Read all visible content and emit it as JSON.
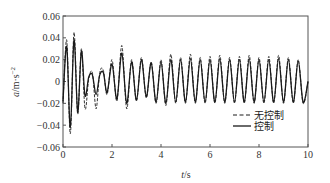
{
  "chart_data": {
    "type": "line",
    "title": "",
    "xlabel": "t/s",
    "ylabel": "a/m·s⁻²",
    "xlim": [
      0,
      10
    ],
    "ylim": [
      -0.06,
      0.06
    ],
    "x_ticks": [
      "0",
      "2",
      "4",
      "6",
      "8",
      "10"
    ],
    "y_ticks": [
      "0.06",
      "0.04",
      "0.02",
      "0",
      "-0.02",
      "-0.04",
      "-0.06"
    ],
    "grid": false,
    "legend_position": "lower right inside",
    "legend": [
      {
        "label": "无控制",
        "style": "dashed"
      },
      {
        "label": "控制",
        "style": "solid"
      }
    ],
    "series": [
      {
        "name": "无控制",
        "style": "dashed",
        "x": [
          0,
          0.15,
          0.3,
          0.45,
          0.6,
          0.75,
          0.9,
          1.05,
          1.2,
          1.35,
          1.5,
          1.65,
          1.8,
          2.0,
          2.2,
          2.4,
          2.6,
          2.8,
          3.0,
          3.2,
          3.4,
          3.6,
          3.8,
          4.0,
          4.2,
          4.4,
          4.6,
          4.8,
          5.0,
          5.2,
          5.4,
          5.6,
          5.8,
          6.0,
          6.2,
          6.4,
          6.6,
          6.8,
          7.0,
          7.2,
          7.4,
          7.6,
          7.8,
          8.0,
          8.2,
          8.4,
          8.6,
          8.8,
          9.0,
          9.2,
          9.4,
          9.6,
          9.8,
          10.0
        ],
        "y": [
          -0.02,
          0.038,
          -0.048,
          0.045,
          -0.03,
          0.03,
          -0.025,
          0.002,
          0.008,
          -0.025,
          0.008,
          0.01,
          -0.012,
          0.02,
          -0.018,
          0.033,
          -0.025,
          0.02,
          -0.018,
          0.022,
          -0.015,
          0.018,
          -0.02,
          0.02,
          -0.022,
          0.025,
          -0.02,
          0.022,
          -0.02,
          0.025,
          -0.02,
          0.022,
          -0.02,
          0.023,
          -0.02,
          0.024,
          -0.02,
          0.022,
          -0.02,
          0.023,
          -0.02,
          0.024,
          -0.02,
          0.022,
          -0.02,
          0.023,
          -0.02,
          0.024,
          -0.02,
          0.022,
          -0.02,
          0.02,
          -0.02,
          0.0
        ]
      },
      {
        "name": "控制",
        "style": "solid",
        "x": [
          0,
          0.15,
          0.3,
          0.45,
          0.6,
          0.75,
          0.9,
          1.05,
          1.2,
          1.35,
          1.5,
          1.65,
          1.8,
          2.0,
          2.2,
          2.4,
          2.6,
          2.8,
          3.0,
          3.2,
          3.4,
          3.6,
          3.8,
          4.0,
          4.2,
          4.4,
          4.6,
          4.8,
          5.0,
          5.2,
          5.4,
          5.6,
          5.8,
          6.0,
          6.2,
          6.4,
          6.6,
          6.8,
          7.0,
          7.2,
          7.4,
          7.6,
          7.8,
          8.0,
          8.2,
          8.4,
          8.6,
          8.8,
          9.0,
          9.2,
          9.4,
          9.6,
          9.8,
          10.0
        ],
        "y": [
          -0.018,
          0.032,
          -0.042,
          0.038,
          -0.028,
          0.028,
          -0.013,
          0.004,
          0.006,
          -0.012,
          0.006,
          0.008,
          -0.01,
          0.016,
          -0.016,
          0.026,
          -0.02,
          0.018,
          -0.017,
          0.02,
          -0.014,
          0.017,
          -0.019,
          0.018,
          -0.02,
          0.02,
          -0.019,
          0.02,
          -0.019,
          0.021,
          -0.019,
          0.02,
          -0.019,
          0.02,
          -0.019,
          0.021,
          -0.019,
          0.02,
          -0.019,
          0.02,
          -0.019,
          0.021,
          -0.019,
          0.02,
          -0.019,
          0.02,
          -0.019,
          0.021,
          -0.019,
          0.02,
          -0.019,
          0.019,
          -0.019,
          0.0
        ]
      }
    ]
  },
  "axes": {
    "x_label_italic": "t",
    "x_label_unit": "/s",
    "y_label_italic": "a",
    "y_label_unit": "/m·s",
    "y_label_exp": "−2"
  },
  "colors": {
    "axis": "#555555",
    "line": "#1a1a1a",
    "text": "#333333"
  }
}
